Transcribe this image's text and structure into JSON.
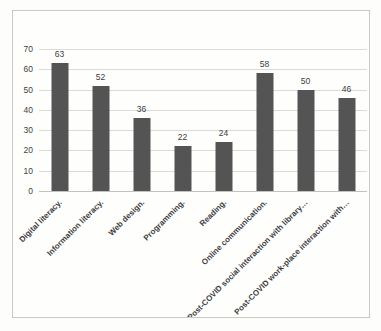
{
  "chart_data": {
    "type": "bar",
    "title": "",
    "xlabel": "",
    "ylabel": "",
    "categories": [
      "Digital literacy.",
      "Information literacy.",
      "Web design.",
      "Programming.",
      "Reading.",
      "Online communication.",
      "Post-COVID social interaction with library…",
      "Post-COVID work-place interaction with…"
    ],
    "values": [
      63,
      52,
      36,
      22,
      24,
      58,
      50,
      46
    ],
    "ylim": [
      0,
      70
    ],
    "yticks": [
      0,
      10,
      20,
      30,
      40,
      50,
      60,
      70
    ],
    "grid": true,
    "legend": false,
    "data_labels": true,
    "colors": {
      "bar": "#545454",
      "gridline": "#dbdbd8",
      "axis_line": "#c2c2bf",
      "text": "#3d3d3d",
      "frame_border": "#c9c9c6",
      "background": "#fefefd"
    }
  }
}
